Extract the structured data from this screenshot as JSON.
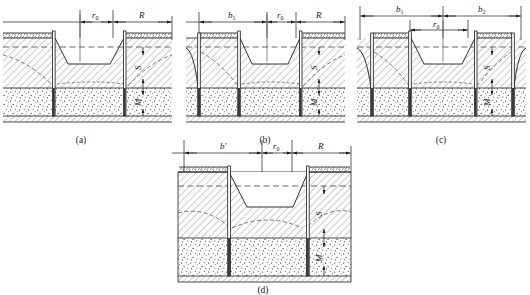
{
  "figure": {
    "type": "engineering-cross-section-diagram",
    "panel_count": 4,
    "colors": {
      "line": "#1a1a1a",
      "hatch": "#555555",
      "dashed_water_table": "#444444",
      "background": "#ffffff",
      "stipple": "#333333"
    }
  },
  "panels": [
    {
      "id": "a",
      "caption": "(a)",
      "dimensions": [
        {
          "name": "r0",
          "symbol": "r",
          "subscript": "0"
        },
        {
          "name": "R",
          "symbol": "R",
          "subscript": ""
        }
      ],
      "vertical_dimensions": [
        {
          "name": "S",
          "symbol": "S"
        },
        {
          "name": "M",
          "symbol": "M"
        }
      ]
    },
    {
      "id": "b",
      "caption": "(b)",
      "dimensions": [
        {
          "name": "b1",
          "symbol": "b",
          "subscript": "1"
        },
        {
          "name": "r0",
          "symbol": "r",
          "subscript": "0"
        },
        {
          "name": "R",
          "symbol": "R",
          "subscript": ""
        }
      ],
      "vertical_dimensions": [
        {
          "name": "S",
          "symbol": "S"
        },
        {
          "name": "M",
          "symbol": "M"
        }
      ]
    },
    {
      "id": "c",
      "caption": "(c)",
      "dimensions": [
        {
          "name": "b1",
          "symbol": "b",
          "subscript": "1"
        },
        {
          "name": "b2",
          "symbol": "b",
          "subscript": "2"
        },
        {
          "name": "r0",
          "symbol": "r",
          "subscript": "0"
        }
      ],
      "vertical_dimensions": [
        {
          "name": "S",
          "symbol": "S"
        },
        {
          "name": "M",
          "symbol": "M"
        }
      ]
    },
    {
      "id": "d",
      "caption": "(d)",
      "dimensions": [
        {
          "name": "b-prime",
          "symbol": "b′",
          "subscript": ""
        },
        {
          "name": "r0",
          "symbol": "r",
          "subscript": "0"
        },
        {
          "name": "R",
          "symbol": "R",
          "subscript": ""
        }
      ],
      "vertical_dimensions": [
        {
          "name": "S",
          "symbol": "S"
        },
        {
          "name": "M",
          "symbol": "M"
        }
      ]
    }
  ],
  "labels": {
    "r0_symbol": "r",
    "r0_sub": "0",
    "R_symbol": "R",
    "b1_symbol": "b",
    "b1_sub": "1",
    "b2_symbol": "b",
    "b2_sub": "2",
    "bprime_symbol": "b′",
    "S_symbol": "S",
    "M_symbol": "M",
    "caption_a": "(a)",
    "caption_b": "(b)",
    "caption_c": "(c)",
    "caption_d": "(d)"
  }
}
